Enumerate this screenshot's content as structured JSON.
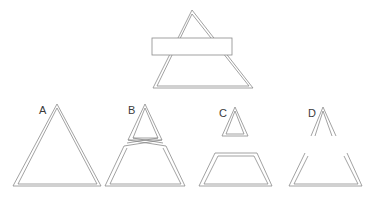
{
  "page": {
    "background_color": "#ffffff",
    "stroke_color": "#8a8a8a",
    "label_color": "#3b3b3b",
    "width": 380,
    "height": 207
  },
  "prompt_figure": {
    "name": "triangle-with-bar",
    "description": "Large outlined triangle crossed horizontally by a white rectangular bar",
    "shapes": [
      {
        "name": "large-triangle",
        "type": "triangle",
        "apex": [
          192,
          10
        ],
        "left_base": [
          153,
          88
        ],
        "right_base": [
          253,
          88
        ]
      },
      {
        "name": "overlay-bar",
        "type": "rectangle",
        "x": 152,
        "y": 38,
        "width": 80,
        "height": 17,
        "fill": "#ffffff"
      }
    ]
  },
  "options": [
    {
      "id": "A",
      "label": "A",
      "name": "option-a",
      "description": "Intact complete triangle, uncut",
      "pieces": [
        "whole-triangle"
      ]
    },
    {
      "id": "B",
      "label": "B",
      "name": "option-b",
      "description": "Top triangle and lower trapezoid with crossed, swapped connecting edges",
      "pieces": [
        "crossed-top-triangle",
        "crossed-trapezoid"
      ]
    },
    {
      "id": "C",
      "label": "C",
      "name": "option-c",
      "description": "Small closed triangle separated above a closed trapezoid",
      "pieces": [
        "closed-small-triangle",
        "closed-trapezoid"
      ]
    },
    {
      "id": "D",
      "label": "D",
      "name": "option-d",
      "description": "Open chevron above an open trapezoid, both missing the cut edge",
      "pieces": [
        "open-chevron",
        "open-trapezoid"
      ]
    }
  ]
}
